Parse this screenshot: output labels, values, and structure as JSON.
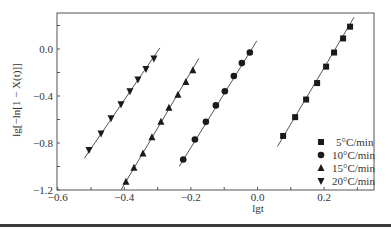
{
  "chart_data": {
    "type": "scatter",
    "title": "",
    "xlabel": "lgt",
    "ylabel": "lg[−ln[1 − X(t)]]",
    "xlim": [
      -0.6,
      0.35
    ],
    "ylim": [
      -1.2,
      0.31
    ],
    "xticks": [
      -0.6,
      -0.4,
      -0.2,
      0.0,
      0.2
    ],
    "xtick_labels": [
      "−0.6",
      "−0.4",
      "−0.2",
      "0.0",
      "0.2"
    ],
    "yticks": [
      0.0,
      -0.4,
      -0.8,
      -1.2
    ],
    "ytick_labels": [
      "0.0",
      "−0.4",
      "−0.8",
      "−1.2"
    ],
    "grid": false,
    "legend_position": "lower right",
    "fit_lines": true,
    "series": [
      {
        "name": "5°C/min",
        "marker": "square",
        "x": [
          0.077,
          0.113,
          0.146,
          0.179,
          0.206,
          0.23,
          0.257,
          0.278
        ],
        "y": [
          -0.74,
          -0.58,
          -0.43,
          -0.29,
          -0.15,
          -0.03,
          0.09,
          0.19
        ],
        "line": [
          [
            0.06,
            -0.83
          ],
          [
            0.29,
            0.27
          ]
        ]
      },
      {
        "name": "10°C/min",
        "marker": "circle",
        "x": [
          -0.223,
          -0.188,
          -0.155,
          -0.125,
          -0.098,
          -0.071,
          -0.047,
          -0.023
        ],
        "y": [
          -0.94,
          -0.77,
          -0.62,
          -0.48,
          -0.36,
          -0.23,
          -0.12,
          -0.03
        ],
        "line": [
          [
            -0.235,
            -1.0
          ],
          [
            -0.002,
            0.07
          ]
        ]
      },
      {
        "name": "15°C/min",
        "marker": "triangle-up",
        "x": [
          -0.395,
          -0.371,
          -0.344,
          -0.317,
          -0.29,
          -0.266,
          -0.239,
          -0.215,
          -0.194
        ],
        "y": [
          -1.13,
          -1.01,
          -0.89,
          -0.75,
          -0.62,
          -0.5,
          -0.39,
          -0.28,
          -0.18
        ],
        "line": [
          [
            -0.41,
            -1.2
          ],
          [
            -0.176,
            -0.08
          ]
        ]
      },
      {
        "name": "20°C/min",
        "marker": "triangle-down",
        "x": [
          -0.506,
          -0.47,
          -0.44,
          -0.41,
          -0.383,
          -0.359,
          -0.335,
          -0.311
        ],
        "y": [
          -0.86,
          -0.72,
          -0.59,
          -0.47,
          -0.36,
          -0.26,
          -0.17,
          -0.08
        ],
        "line": [
          [
            -0.52,
            -0.93
          ],
          [
            -0.293,
            0.01
          ]
        ]
      }
    ]
  },
  "labels": {
    "xlabel": "lgt",
    "ylabel": "lg[−ln[1 − X(t)]]",
    "legend": [
      "5°C/min",
      "10°C/min",
      "15°C/min",
      "20°C/min"
    ]
  },
  "colors": {
    "axis": "#555555",
    "marker": "#1a1a1a",
    "line": "#555555"
  }
}
